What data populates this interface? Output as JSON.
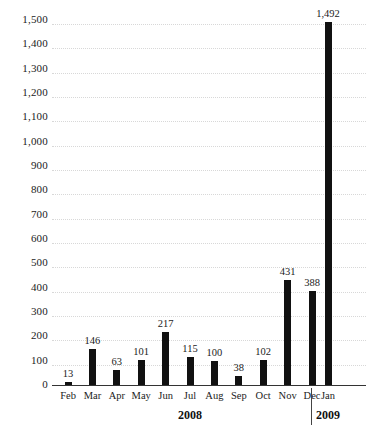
{
  "chart_data": {
    "type": "bar",
    "title": "",
    "subtitle": "",
    "xlabel": "",
    "ylabel": "",
    "categories": [
      "Feb",
      "Mar",
      "Apr",
      "May",
      "Jun",
      "Jul",
      "Aug",
      "Sep",
      "Oct",
      "Nov",
      "Dec",
      "Jan"
    ],
    "values": [
      13,
      146,
      63,
      101,
      217,
      115,
      100,
      38,
      102,
      431,
      388,
      1492
    ],
    "value_labels": [
      "13",
      "146",
      "63",
      "101",
      "217",
      "115",
      "100",
      "38",
      "102",
      "431",
      "388",
      "1,492"
    ],
    "ylim": [
      0,
      1500
    ],
    "yticks": [
      0,
      100,
      200,
      300,
      400,
      500,
      600,
      700,
      800,
      900,
      1000,
      1100,
      1200,
      1300,
      1400,
      1500
    ],
    "ytick_labels": [
      "0",
      "100",
      "200",
      "300",
      "400",
      "500",
      "600",
      "700",
      "800",
      "900",
      "1,000",
      "1,100",
      "1,200",
      "1,300",
      "1,400",
      "1,500"
    ],
    "grid": true,
    "grid_axis": "y",
    "legend": false,
    "bar_color": "#111111",
    "grid_color": "#d8d8d8",
    "axis_color": "#333333",
    "groups": [
      {
        "label": "2008",
        "categories": [
          "Feb",
          "Mar",
          "Apr",
          "May",
          "Jun",
          "Jul",
          "Aug",
          "Sep",
          "Oct",
          "Nov",
          "Dec"
        ]
      },
      {
        "label": "2009",
        "categories": [
          "Jan"
        ]
      }
    ],
    "group_separator_after": "Dec"
  }
}
